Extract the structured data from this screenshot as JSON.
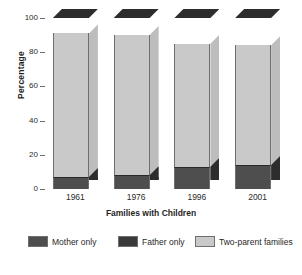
{
  "chart_data": {
    "type": "bar",
    "subtype": "stacked-bar-3d",
    "title": "",
    "xlabel": "Families with Children",
    "ylabel": "Percentage",
    "ylim": [
      0,
      100
    ],
    "yticks": [
      0,
      20,
      40,
      60,
      80,
      100
    ],
    "ytick_labels": [
      "0",
      "20",
      "40",
      "60",
      "80",
      "100"
    ],
    "grid": false,
    "legend_position": "bottom",
    "categories": [
      "1961",
      "1976",
      "1996",
      "2001"
    ],
    "series": [
      {
        "name": "Two-parent families",
        "color": "#c9c9c9",
        "values": [
          91,
          90,
          85,
          84
        ]
      },
      {
        "name": "Father only",
        "color": "#3a3a3a",
        "values": [
          2,
          2,
          2,
          2
        ]
      },
      {
        "name": "Mother only",
        "color": "#4e4e4e",
        "values": [
          7,
          8,
          13,
          14
        ]
      }
    ],
    "stack_order_bottom_to_top": [
      "Two-parent families",
      "Father only",
      "Mother only"
    ]
  },
  "axes": {
    "y_title": "Percentage",
    "x_title": "Families with Children",
    "y_ticks": [
      "100",
      "80",
      "60",
      "40",
      "20",
      "0"
    ],
    "x_ticks": [
      "1961",
      "1976",
      "1996",
      "2001"
    ]
  },
  "legend": {
    "items": [
      {
        "label": "Mother only",
        "color": "#4e4e4e"
      },
      {
        "label": "Father only",
        "color": "#3a3a3a"
      },
      {
        "label": "Two-parent families",
        "color": "#c9c9c9"
      }
    ]
  },
  "colors": {
    "background": "#ffffff",
    "axis": "#6d6d6d",
    "text": "#1f1f1f",
    "bar_face_light": "#c9c9c9",
    "bar_side_light": "#bdbdbd",
    "bar_face_mother": "#4e4e4e",
    "bar_face_father": "#3a3a3a",
    "bar_side_dark": "#2d2d2d"
  }
}
